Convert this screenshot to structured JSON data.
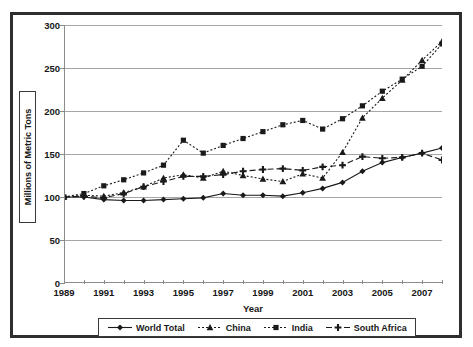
{
  "chart_data": {
    "type": "line",
    "title": "",
    "xlabel": "Year",
    "ylabel": "Millions of Metric Tons",
    "xlim": [
      1989,
      2008
    ],
    "ylim": [
      0,
      300
    ],
    "grid": true,
    "legend_position": "bottom",
    "x": [
      1989,
      1990,
      1991,
      1992,
      1993,
      1994,
      1995,
      1996,
      1997,
      1998,
      1999,
      2000,
      2001,
      2002,
      2003,
      2004,
      2005,
      2006,
      2007,
      2008
    ],
    "x_tick_labels": [
      "1989",
      "1991",
      "1993",
      "1995",
      "1997",
      "1999",
      "2001",
      "2003",
      "2005",
      "2007"
    ],
    "y_tick_labels": [
      "0",
      "50",
      "100",
      "150",
      "200",
      "250",
      "300"
    ],
    "y_ticks": [
      0,
      50,
      100,
      150,
      200,
      250,
      300
    ],
    "series": [
      {
        "name": "World Total",
        "marker": "diamond",
        "line_style": "solid",
        "color": "#1a1a1a",
        "values": [
          100,
          100,
          97,
          96,
          96,
          97,
          98,
          99,
          104,
          102,
          102,
          101,
          105,
          110,
          117,
          130,
          140,
          146,
          151,
          157
        ]
      },
      {
        "name": "China",
        "marker": "triangle",
        "line_style": "dotted",
        "color": "#1a1a1a",
        "values": [
          100,
          102,
          101,
          105,
          112,
          122,
          126,
          122,
          130,
          125,
          121,
          118,
          127,
          122,
          152,
          192,
          215,
          236,
          259,
          281
        ]
      },
      {
        "name": "India",
        "marker": "square",
        "line_style": "dotted",
        "color": "#1a1a1a",
        "values": [
          100,
          104,
          113,
          120,
          128,
          137,
          166,
          151,
          160,
          168,
          176,
          184,
          189,
          179,
          191,
          206,
          223,
          237,
          252,
          278
        ]
      },
      {
        "name": "South Africa",
        "marker": "cross",
        "line_style": "dashed",
        "color": "#1a1a1a",
        "values": [
          100,
          101,
          99,
          104,
          112,
          118,
          124,
          124,
          126,
          130,
          132,
          133,
          131,
          135,
          137,
          147,
          145,
          146,
          151,
          143
        ]
      }
    ]
  },
  "axes": {
    "y_title": "Millions of Metric Tons",
    "x_title": "Year"
  },
  "legend": {
    "items": [
      {
        "label": "World Total"
      },
      {
        "label": "China"
      },
      {
        "label": "India"
      },
      {
        "label": "South Africa"
      }
    ]
  }
}
